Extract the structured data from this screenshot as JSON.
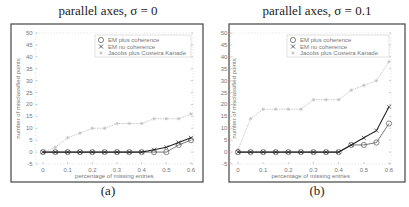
{
  "panels": [
    {
      "title": "parallel axes, σ = 0",
      "caption": "(a)"
    },
    {
      "title": "parallel axes, σ = 0.1",
      "caption": "(b)"
    }
  ],
  "chart_data": [
    {
      "type": "line",
      "title": "parallel axes, σ = 0",
      "caption": "(a)",
      "xlabel": "percentage of missing entries",
      "ylabel": "number of misclassified points",
      "xlim": [
        -0.03,
        0.6
      ],
      "ylim": [
        -5,
        50
      ],
      "xticks": [
        0,
        0.1,
        0.2,
        0.3,
        0.4,
        0.5,
        0.6
      ],
      "xtick_labels": [
        "0",
        "0.1",
        "0.2",
        "0.3",
        "0.4",
        "0.5",
        "0.6"
      ],
      "yticks": [
        -5,
        0,
        5,
        10,
        15,
        20,
        25,
        30,
        35,
        40,
        45,
        50
      ],
      "grid": false,
      "legend_position": "upper right",
      "x": [
        0,
        0.05,
        0.1,
        0.15,
        0.2,
        0.25,
        0.3,
        0.35,
        0.4,
        0.45,
        0.5,
        0.55,
        0.6
      ],
      "series": [
        {
          "name": "EM plus coherence",
          "marker": "circle",
          "color": "#555555",
          "values": [
            0,
            0,
            0,
            0,
            0,
            0,
            0,
            0,
            0,
            0,
            0,
            3,
            5
          ]
        },
        {
          "name": "EM no coherence",
          "marker": "x",
          "color": "#222222",
          "values": [
            0,
            0,
            0,
            0,
            0,
            0,
            0,
            0,
            0,
            1,
            2,
            4,
            6
          ]
        },
        {
          "name": "Jacobs plus Costeira Kanade",
          "marker": "star",
          "color": "#bbbbbb",
          "values": [
            0,
            2,
            6,
            8,
            10,
            10,
            12,
            12,
            12,
            14,
            14,
            14,
            16
          ]
        }
      ]
    },
    {
      "type": "line",
      "title": "parallel axes, σ = 0.1",
      "caption": "(b)",
      "xlabel": "percentage of missing entries",
      "ylabel": "number of misclassified points",
      "xlim": [
        -0.03,
        0.6
      ],
      "ylim": [
        -5,
        50
      ],
      "xticks": [
        0,
        0.1,
        0.2,
        0.3,
        0.4,
        0.5,
        0.6
      ],
      "xtick_labels": [
        "0",
        "0.1",
        "0.2",
        "0.3",
        "0.4",
        "0.5",
        "0.6"
      ],
      "yticks": [
        -5,
        0,
        5,
        10,
        15,
        20,
        25,
        30,
        35,
        40,
        45,
        50
      ],
      "grid": false,
      "legend_position": "upper right",
      "x": [
        0,
        0.05,
        0.1,
        0.15,
        0.2,
        0.25,
        0.3,
        0.35,
        0.4,
        0.45,
        0.5,
        0.55,
        0.6
      ],
      "series": [
        {
          "name": "EM plus coherence",
          "marker": "circle",
          "color": "#555555",
          "values": [
            0,
            0,
            0,
            0,
            0,
            0,
            0,
            0,
            0,
            3,
            3,
            4,
            12
          ]
        },
        {
          "name": "EM no coherence",
          "marker": "x",
          "color": "#222222",
          "values": [
            0,
            0,
            0,
            0,
            0,
            0,
            0,
            0,
            0,
            3,
            6,
            9,
            19
          ]
        },
        {
          "name": "Jacobs plus Costeira Kanade",
          "marker": "star",
          "color": "#bbbbbb",
          "values": [
            1,
            14,
            18,
            18,
            18,
            18,
            22,
            22,
            22,
            26,
            28,
            30,
            38
          ]
        }
      ]
    }
  ]
}
